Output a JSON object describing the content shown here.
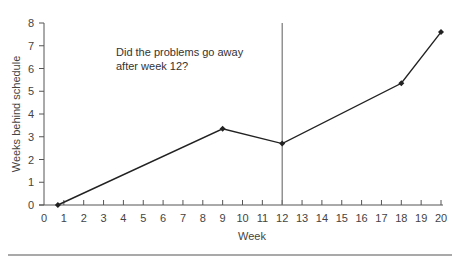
{
  "chart_data": {
    "type": "line",
    "title": "",
    "xlabel": "Week",
    "ylabel": "Weeks behind schedule",
    "xlim": [
      0,
      20
    ],
    "ylim": [
      0,
      8
    ],
    "xticks": [
      0,
      1,
      2,
      3,
      4,
      5,
      6,
      7,
      8,
      9,
      10,
      11,
      12,
      13,
      14,
      15,
      16,
      17,
      18,
      19,
      20
    ],
    "yticks": [
      0,
      1,
      2,
      3,
      4,
      5,
      6,
      7,
      8
    ],
    "grid": false,
    "legend": null,
    "series": [
      {
        "name": "Weeks behind schedule",
        "x": [
          0.7,
          9,
          12,
          18,
          20
        ],
        "y": [
          0,
          3.35,
          2.7,
          5.35,
          7.6
        ],
        "marker": "diamond",
        "color": "#222222"
      }
    ],
    "reference_lines": [
      {
        "orientation": "vertical",
        "x": 12,
        "color": "#777777"
      }
    ],
    "annotations": [
      {
        "text_lines": [
          "Did the problems go away",
          "after week 12?"
        ],
        "x": 2.4,
        "y": 7.1
      }
    ]
  }
}
